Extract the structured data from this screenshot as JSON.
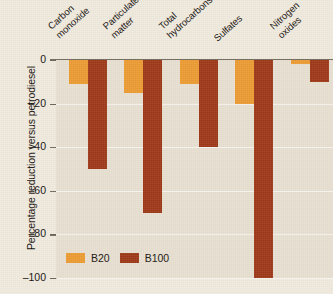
{
  "chart_data": {
    "type": "bar",
    "title": "",
    "subtitle": "",
    "xlabel": "",
    "ylabel": "Percentage reduction versus petrodiesel",
    "categories": [
      "Carbon monoxide",
      "Particulate matter",
      "Total hydrocarbons",
      "Sulfates",
      "Nitrogen oxides"
    ],
    "category_lines": [
      [
        "Carbon",
        "monoxide"
      ],
      [
        "Particulate",
        "matter"
      ],
      [
        "Total",
        "hydrocarbons"
      ],
      [
        "Sulfates",
        ""
      ],
      [
        "Nitrogen",
        "oxides"
      ]
    ],
    "series": [
      {
        "name": "B20",
        "color": "#eb9a30",
        "values": [
          -11,
          -15,
          -11,
          -20,
          -2
        ]
      },
      {
        "name": "B100",
        "color": "#9c3615",
        "values": [
          -50,
          -70,
          -40,
          -100,
          -10
        ]
      }
    ],
    "ylim": [
      -100,
      0
    ],
    "yticks": [
      0,
      -20,
      -40,
      -60,
      -80,
      -100
    ],
    "ytick_labels": [
      "0",
      "–20",
      "–40",
      "–60",
      "–80",
      "–100"
    ],
    "grid": true,
    "grid_axis": "y",
    "legend_position": "bottom-left",
    "orientation": "vertical",
    "bar_direction": "downward"
  },
  "legend": {
    "items": [
      {
        "label": "B20",
        "color": "#eb9a30"
      },
      {
        "label": "B100",
        "color": "#9c3615"
      }
    ]
  },
  "colors": {
    "page_background": "#efe9dd",
    "plot_background": "#e7dfd0",
    "axis": "#6d6458",
    "gridline": "#ffffff",
    "text": "#15100c",
    "b20": "#eb9a30",
    "b100": "#9c3615"
  }
}
